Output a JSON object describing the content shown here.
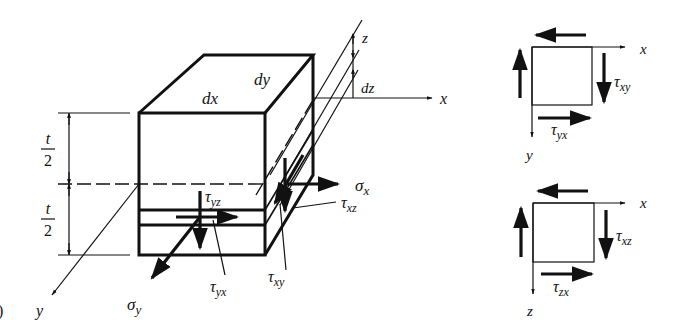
{
  "figure": {
    "panel_marker": ")",
    "element": {
      "dx_label": "dx",
      "dy_label": "dy",
      "dz_label": "dz",
      "half_thickness": {
        "numerator": "t",
        "denominator": "2"
      }
    },
    "axes": {
      "x": "x",
      "y": "y",
      "z": "z"
    },
    "stresses": {
      "sigma_x": {
        "base": "σ",
        "sub": "x"
      },
      "sigma_y": {
        "base": "σ",
        "sub": "y"
      },
      "tau_yz": {
        "base": "τ",
        "sub": "yz"
      },
      "tau_xz": {
        "base": "τ",
        "sub": "xz"
      },
      "tau_yx": {
        "base": "τ",
        "sub": "yx"
      },
      "tau_xy": {
        "base": "τ",
        "sub": "xy"
      }
    },
    "inset_xy": {
      "axis_h": "x",
      "axis_v": "y",
      "tau_side": {
        "base": "τ",
        "sub": "xy"
      },
      "tau_bottom": {
        "base": "τ",
        "sub": "yx"
      }
    },
    "inset_xz": {
      "axis_h": "x",
      "axis_v": "z",
      "tau_side": {
        "base": "τ",
        "sub": "xz"
      },
      "tau_bottom": {
        "base": "τ",
        "sub": "zx"
      }
    }
  }
}
